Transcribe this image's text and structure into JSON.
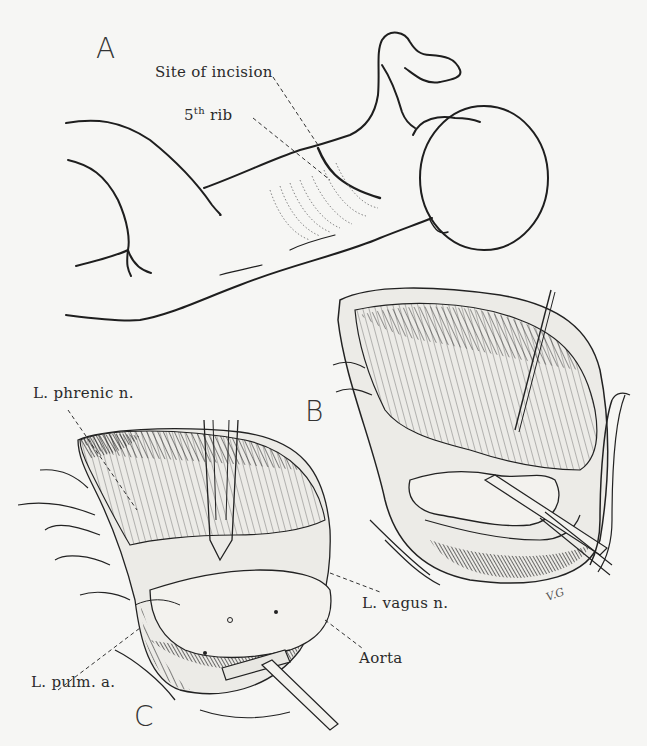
{
  "figure": {
    "background_color": "#f6f6f4",
    "ink_color": "#1e1e1e",
    "panels": {
      "A": {
        "label": "A"
      },
      "B": {
        "label": "B"
      },
      "C": {
        "label": "C"
      }
    },
    "annotations": {
      "site_of_incision": "Site of incision",
      "fifth_rib_num": "5",
      "fifth_rib_sup": "th",
      "fifth_rib_word": "rib",
      "phrenic": "L. phrenic n.",
      "vagus": "L. vagus n.",
      "aorta": "Aorta",
      "pulm": "L. pulm. a."
    },
    "artist_signature": "V.G"
  }
}
